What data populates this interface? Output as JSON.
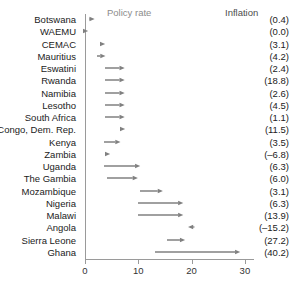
{
  "chart": {
    "legend": {
      "policy_rate": "Policy rate",
      "inflation": "Inflation"
    },
    "colors": {
      "arrow": "#808080",
      "axis": "#9a9a9a",
      "text": "#222222",
      "legend_muted": "#8c8c8c"
    }
  },
  "chart_data": {
    "type": "bar",
    "title": "",
    "xlabel": "",
    "ylabel": "",
    "xlim": [
      0,
      31.5
    ],
    "grid": false,
    "legend_position": "top",
    "x_ticks": [
      0,
      10,
      20,
      30
    ],
    "x_tick_labels": [
      "0",
      "10",
      "20",
      "30"
    ],
    "series": [
      {
        "name": "Policy rate start (previous)",
        "values": [
          1.3,
          0.0,
          3.2,
          2.2,
          3.8,
          3.8,
          3.8,
          3.8,
          3.8,
          7.0,
          3.5,
          4.2,
          3.5,
          4.2,
          10.3,
          9.9,
          9.9,
          20.5,
          15.4,
          13.1
        ]
      },
      {
        "name": "Policy rate end (current)",
        "values": [
          1.8,
          0.6,
          3.8,
          3.8,
          7.5,
          7.5,
          7.5,
          7.5,
          7.5,
          7.6,
          6.6,
          4.8,
          10.3,
          10.0,
          14.6,
          18.4,
          18.4,
          19.3,
          18.8,
          29.1
        ]
      }
    ],
    "categories": [
      "Botswana",
      "WAEMU",
      "CEMAC",
      "Mauritius",
      "Eswatini",
      "Rwanda",
      "Namibia",
      "Lesotho",
      "South Africa",
      "Congo, Dem. Rep.",
      "Kenya",
      "Zambia",
      "Uganda",
      "The Gambia",
      "Mozambique",
      "Nigeria",
      "Malawi",
      "Angola",
      "Sierra Leone",
      "Ghana"
    ],
    "inflation_labels": [
      "(0.4)",
      "(0.0)",
      "(3.1)",
      "(4.2)",
      "(2.4)",
      "(18.8)",
      "(2.6)",
      "(4.5)",
      "(1.1)",
      "(11.5)",
      "(3.5)",
      "(–6.8)",
      "(6.3)",
      "(6.0)",
      "(3.1)",
      "(6.3)",
      "(13.9)",
      "(–15.2)",
      "(27.2)",
      "(40.2)"
    ],
    "inflation_values": [
      0.4,
      0.0,
      3.1,
      4.2,
      2.4,
      18.8,
      2.6,
      4.5,
      1.1,
      11.5,
      3.5,
      -6.8,
      6.3,
      6.0,
      3.1,
      6.3,
      13.9,
      -15.2,
      27.2,
      40.2
    ],
    "rows": [
      {
        "category": "Botswana",
        "start": 1.3,
        "end": 1.8,
        "inflation": "(0.4)"
      },
      {
        "category": "WAEMU",
        "start": 0.0,
        "end": 0.6,
        "inflation": "(0.0)"
      },
      {
        "category": "CEMAC",
        "start": 3.2,
        "end": 3.8,
        "inflation": "(3.1)"
      },
      {
        "category": "Mauritius",
        "start": 2.2,
        "end": 3.8,
        "inflation": "(4.2)"
      },
      {
        "category": "Eswatini",
        "start": 3.8,
        "end": 7.5,
        "inflation": "(2.4)"
      },
      {
        "category": "Rwanda",
        "start": 3.8,
        "end": 7.5,
        "inflation": "(18.8)"
      },
      {
        "category": "Namibia",
        "start": 3.8,
        "end": 7.5,
        "inflation": "(2.6)"
      },
      {
        "category": "Lesotho",
        "start": 3.8,
        "end": 7.5,
        "inflation": "(4.5)"
      },
      {
        "category": "South Africa",
        "start": 3.8,
        "end": 7.5,
        "inflation": "(1.1)"
      },
      {
        "category": "Congo, Dem. Rep.",
        "start": 7.0,
        "end": 7.6,
        "inflation": "(11.5)"
      },
      {
        "category": "Kenya",
        "start": 3.5,
        "end": 6.6,
        "inflation": "(3.5)"
      },
      {
        "category": "Zambia",
        "start": 4.2,
        "end": 4.8,
        "inflation": "(–6.8)"
      },
      {
        "category": "Uganda",
        "start": 3.5,
        "end": 10.3,
        "inflation": "(6.3)"
      },
      {
        "category": "The Gambia",
        "start": 4.2,
        "end": 10.0,
        "inflation": "(6.0)"
      },
      {
        "category": "Mozambique",
        "start": 10.3,
        "end": 14.6,
        "inflation": "(3.1)"
      },
      {
        "category": "Nigeria",
        "start": 9.9,
        "end": 18.4,
        "inflation": "(6.3)"
      },
      {
        "category": "Malawi",
        "start": 9.9,
        "end": 18.4,
        "inflation": "(13.9)"
      },
      {
        "category": "Angola",
        "start": 20.5,
        "end": 19.3,
        "inflation": "(–15.2)"
      },
      {
        "category": "Sierra Leone",
        "start": 15.4,
        "end": 18.8,
        "inflation": "(27.2)"
      },
      {
        "category": "Ghana",
        "start": 13.1,
        "end": 29.1,
        "inflation": "(40.2)"
      }
    ]
  }
}
